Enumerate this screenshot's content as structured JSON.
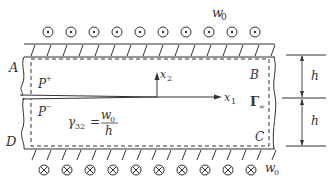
{
  "diagram": {
    "labels": {
      "top_displacement": "w",
      "top_displacement_sub": "0",
      "bottom_displacement": "w",
      "bottom_displacement_sub": "0",
      "corner_A": "A",
      "corner_B": "B",
      "corner_C": "C",
      "corner_D": "D",
      "upper_face": "P",
      "upper_face_sup": "+",
      "lower_face": "P",
      "lower_face_sup": "−",
      "axis_x1": "x",
      "axis_x1_sub": "1",
      "axis_x2": "x",
      "axis_x2_sub": "2",
      "contour": "Γ",
      "contour_sub": "∞",
      "strain_symbol": "γ",
      "strain_sub": "32",
      "strain_equals": "=",
      "strain_num": "w",
      "strain_num_sub": "0",
      "strain_den": "h",
      "height_upper": "h",
      "height_lower": "h"
    },
    "symbols": {
      "top_row": "out-of-plane (⊙)",
      "top_count": 10,
      "bottom_row": "into-plane (⊗)",
      "bottom_count": 10
    },
    "colors": {
      "stroke": "#333333",
      "background": "#ffffff"
    }
  }
}
